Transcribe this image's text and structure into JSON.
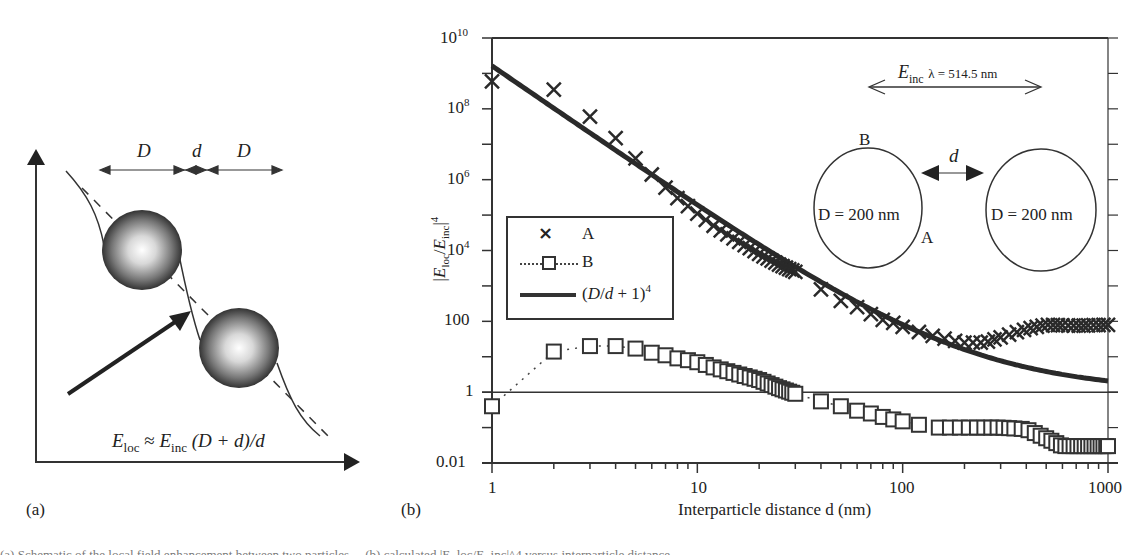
{
  "panel_a": {
    "label": "(a)",
    "dim_labels": [
      "D",
      "d",
      "D"
    ],
    "formula": {
      "lhs": "E",
      "lhs_sub": "loc",
      "approx": "≈",
      "rhs": "E",
      "rhs_sub": "inc",
      "tail": "(D + d)/d"
    }
  },
  "panel_b": {
    "label": "(b)",
    "annotation": {
      "field": "E",
      "field_sub": "inc",
      "wavelength": "λ = 514.5 nm",
      "gap_label": "d",
      "point_top": "B",
      "point_side": "A",
      "particle_left": "D = 200 nm",
      "particle_right": "D = 200 nm"
    },
    "legend": {
      "items": [
        {
          "marker": "×",
          "label": "A"
        },
        {
          "marker": "□",
          "label": "B"
        },
        {
          "marker": "line",
          "label": "(D/d + 1)⁴"
        }
      ]
    }
  },
  "caption_partial": "(a) Schematic of the local field enhancement between two particles ... (b) calculated |E_loc/E_inc|^4 versus interparticle distance",
  "chart_data": {
    "type": "scatter",
    "title": "",
    "xlabel": "Interparticle distance d (nm)",
    "ylabel": "|E_loc/E_inc|^4",
    "xscale": "log",
    "yscale": "log",
    "xlim": [
      1,
      1000
    ],
    "ylim": [
      0.01,
      10000000000
    ],
    "xticks": [
      "1",
      "10",
      "100",
      "1000"
    ],
    "yticks": [
      "0.01",
      "1",
      "100",
      "10^4",
      "10^6",
      "10^8",
      "10^10"
    ],
    "reference_line_y": 1,
    "grid": false,
    "legend_position": "center-left",
    "series": [
      {
        "name": "A",
        "marker": "x",
        "x": [
          1,
          2,
          3,
          4,
          5,
          6,
          7,
          8,
          9,
          10,
          12,
          15,
          20,
          25,
          30,
          40,
          50,
          60,
          70,
          80,
          90,
          100,
          120,
          150,
          200,
          250,
          300,
          400,
          500,
          700,
          1000
        ],
        "y": [
          600000000.0,
          350000000.0,
          60000000.0,
          15000000.0,
          4000000.0,
          1400000.0,
          600000.0,
          300000.0,
          180000.0,
          110000.0,
          50000.0,
          22000.0,
          8000.0,
          4000.0,
          2500.0,
          800,
          380,
          250,
          160,
          110,
          90,
          70,
          50,
          35,
          25,
          25,
          35,
          60,
          80,
          75,
          80
        ]
      },
      {
        "name": "B",
        "marker": "square",
        "line": "dotted",
        "x": [
          1,
          2,
          3,
          4,
          5,
          6,
          7,
          8,
          9,
          10,
          12,
          15,
          20,
          25,
          30,
          40,
          50,
          60,
          70,
          80,
          90,
          100,
          120,
          150,
          200,
          300,
          400,
          500,
          600,
          700,
          1000
        ],
        "y": [
          0.4,
          14,
          20,
          20,
          17,
          13,
          11,
          9,
          8,
          7,
          5,
          3.5,
          2.2,
          1.3,
          0.9,
          0.55,
          0.4,
          0.3,
          0.25,
          0.2,
          0.17,
          0.15,
          0.12,
          0.1,
          0.1,
          0.1,
          0.09,
          0.05,
          0.03,
          0.03,
          0.03
        ]
      },
      {
        "name": "(D/d+1)^4",
        "type": "line",
        "formula": "(200/d + 1)^4",
        "x": [
          1,
          2,
          5,
          10,
          20,
          50,
          100,
          200,
          500,
          1000
        ],
        "y": [
          1630000000.0,
          104000000.0,
          2830000.0,
          194000.0,
          14600.0,
          625,
          81,
          16,
          3.84,
          2.07
        ]
      }
    ]
  }
}
